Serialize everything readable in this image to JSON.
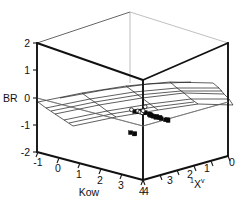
{
  "chart_data": {
    "type": "scatter",
    "projection": "3d",
    "title": "",
    "subtitle": "",
    "xlabel": "Kow",
    "ylabel": "BR",
    "zlabel": "1Xv",
    "zlabel_display": "¹Xᵛ",
    "xlim": [
      -1,
      4
    ],
    "ylim": [
      -2,
      2
    ],
    "zlim": [
      0,
      4
    ],
    "grid": true,
    "legend": null,
    "axes": {
      "vertical": {
        "name": "BR",
        "label": "BR",
        "ticks": [
          2,
          1,
          0,
          -1,
          -2
        ],
        "tick_labels": [
          "2",
          "1",
          "0",
          "-1",
          "-2"
        ],
        "range": [
          -2,
          2
        ]
      },
      "depth_left": {
        "name": "Kow",
        "label": "Kow",
        "ticks": [
          -1,
          0,
          1,
          2,
          3,
          4
        ],
        "tick_labels": [
          "-1",
          "0",
          "1",
          "2",
          "3",
          "4"
        ],
        "range": [
          -1,
          4
        ]
      },
      "depth_right": {
        "name": "1Xv",
        "label": "¹Xᵛ",
        "ticks": [
          4,
          3,
          2,
          1,
          0
        ],
        "tick_labels": [
          "4",
          "3",
          "2",
          "1",
          "0"
        ],
        "range": [
          0,
          4
        ]
      }
    },
    "surface": {
      "description": "fitted regression mesh plane",
      "br_level_range": [
        -0.75,
        -0.05
      ],
      "rows": 5,
      "cols": 7
    },
    "series": [
      {
        "name": "filled",
        "marker": "filled-square",
        "points": [
          {
            "kow": 1.55,
            "xv": 1.95,
            "br": -0.42
          },
          {
            "kow": 1.7,
            "xv": 1.9,
            "br": -0.4
          },
          {
            "kow": 1.8,
            "xv": 2.05,
            "br": -0.36
          },
          {
            "kow": 1.88,
            "xv": 1.8,
            "br": -0.44
          },
          {
            "kow": 1.95,
            "xv": 2.1,
            "br": -0.3
          },
          {
            "kow": 2.05,
            "xv": 1.75,
            "br": -0.47
          },
          {
            "kow": 2.1,
            "xv": 2.0,
            "br": -0.34
          },
          {
            "kow": 2.2,
            "xv": 2.2,
            "br": -0.28
          },
          {
            "kow": 2.28,
            "xv": 1.85,
            "br": -0.45
          },
          {
            "kow": 2.35,
            "xv": 2.05,
            "br": -0.33
          },
          {
            "kow": 2.45,
            "xv": 1.7,
            "br": -0.52
          },
          {
            "kow": 2.52,
            "xv": 2.15,
            "br": -0.3
          },
          {
            "kow": 2.6,
            "xv": 1.95,
            "br": -0.38
          },
          {
            "kow": 2.7,
            "xv": 2.35,
            "br": -0.24
          },
          {
            "kow": 2.78,
            "xv": 1.6,
            "br": -0.58
          },
          {
            "kow": 2.85,
            "xv": 2.05,
            "br": -0.35
          },
          {
            "kow": 2.95,
            "xv": 2.45,
            "br": -0.2
          },
          {
            "kow": 3.05,
            "xv": 1.9,
            "br": -0.42
          },
          {
            "kow": 3.15,
            "xv": 2.55,
            "br": -0.18
          },
          {
            "kow": 3.3,
            "xv": 2.25,
            "br": -0.3
          },
          {
            "kow": 3.45,
            "xv": 2.6,
            "br": -0.15
          },
          {
            "kow": 0.85,
            "xv": 1.45,
            "br": -1.45
          },
          {
            "kow": 1.0,
            "xv": 1.4,
            "br": -1.48
          },
          {
            "kow": 1.1,
            "xv": 1.5,
            "br": -1.42
          }
        ]
      },
      {
        "name": "open",
        "marker": "open-circle",
        "points": [
          {
            "kow": 2.05,
            "xv": 2.3,
            "br": -0.22
          },
          {
            "kow": 2.3,
            "xv": 2.45,
            "br": -0.18
          },
          {
            "kow": 2.55,
            "xv": 2.6,
            "br": -0.12
          },
          {
            "kow": 2.8,
            "xv": 2.8,
            "br": 0.05
          },
          {
            "kow": 3.1,
            "xv": 3.0,
            "br": 0.3
          },
          {
            "kow": 1.7,
            "xv": 2.25,
            "br": -0.26
          }
        ]
      }
    ]
  }
}
